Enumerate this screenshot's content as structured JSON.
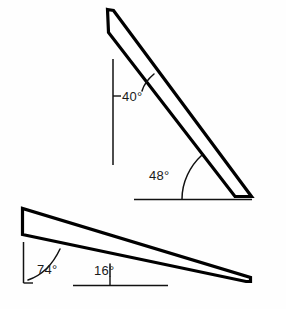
{
  "figure": {
    "background_color": "#fefefe",
    "line_color": "#000000",
    "text_color": "#1a1a1a"
  },
  "upper_wedge": {
    "name": "upper-wedge",
    "description": "Steeply inclined elongated wedge, apex at upper left, thick end at lower right resting on a horizontal baseline",
    "angle_from_vertical": {
      "value": "40",
      "degree_symbol": "°",
      "label": "40°"
    },
    "angle_from_horizontal": {
      "value": "48",
      "degree_symbol": "°",
      "label": "48°"
    }
  },
  "lower_wedge": {
    "name": "lower-wedge",
    "description": "Shallowly inclined elongated wedge, blunt end at upper left, tapering to a point at lower right",
    "angle_from_vertical": {
      "value": "74",
      "degree_symbol": "°",
      "label": "74°"
    },
    "angle_from_horizontal": {
      "value": "16",
      "degree_symbol": "°",
      "label": "16°"
    }
  },
  "labels": {
    "upper_vertical": "40°",
    "upper_horizontal": "48°",
    "lower_vertical": "74°",
    "lower_horizontal": "16°"
  }
}
